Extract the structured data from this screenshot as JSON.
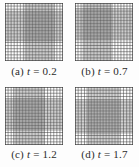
{
  "figure": {
    "type": "adaptive-moving-mesh-sequence",
    "background": "#fdfdfd",
    "mesh": {
      "grid_color": "#3d3d3d",
      "border_color": "#333333",
      "intervals": 30,
      "density_ratio": 2.1,
      "size_px": 58
    },
    "panels": [
      {
        "id": "a",
        "caption_index": "(a)",
        "caption_var": "t",
        "caption_value": "= 0.2",
        "caption_full": "(a) t = 0.2",
        "dense_x0": 0.33,
        "dense_x1": 0.86,
        "dense_y0": 0.13,
        "dense_y1": 0.67
      },
      {
        "id": "b",
        "caption_index": "(b)",
        "caption_var": "t",
        "caption_value": "= 0.7",
        "caption_full": "(b) t = 0.7",
        "dense_x0": 0.13,
        "dense_x1": 0.64,
        "dense_y0": 0.09,
        "dense_y1": 0.64
      },
      {
        "id": "c",
        "caption_index": "(c)",
        "caption_var": "t",
        "caption_value": "= 1.2",
        "caption_full": "(c) t = 1.2",
        "dense_x0": 0.14,
        "dense_x1": 0.68,
        "dense_y0": 0.19,
        "dense_y1": 0.75
      },
      {
        "id": "d",
        "caption_index": "(d)",
        "caption_var": "t",
        "caption_value": "= 1.7",
        "caption_full": "(d) t = 1.7",
        "dense_x0": 0.2,
        "dense_x1": 0.78,
        "dense_y0": 0.22,
        "dense_y1": 0.8
      }
    ]
  }
}
